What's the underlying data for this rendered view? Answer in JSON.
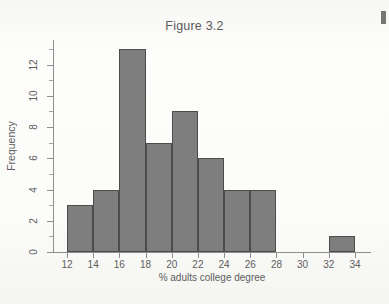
{
  "figure": {
    "title": "Figure 3.2"
  },
  "axes": {
    "y_title": "Frequency",
    "x_title": "% adults college degree",
    "y_ticks": [
      "0",
      "2",
      "4",
      "6",
      "8",
      "10",
      "12"
    ],
    "y_tick_values": [
      0,
      2,
      4,
      6,
      8,
      10,
      12
    ],
    "y_minor_values": [
      1,
      3,
      5,
      7,
      9,
      11,
      13
    ],
    "x_ticks": [
      "12",
      "14",
      "16",
      "18",
      "20",
      "22",
      "24",
      "26",
      "28",
      "30",
      "32",
      "34"
    ],
    "x_tick_values": [
      12,
      14,
      16,
      18,
      20,
      22,
      24,
      26,
      28,
      30,
      32,
      34
    ]
  },
  "style": {
    "bar_fill": "#7e7e7e",
    "bar_stroke": "#4c4c4c",
    "axis_color": "#8e8e8e",
    "text_color": "#5d5d5d",
    "page_background": "#fdfdfb"
  },
  "chart_data": {
    "type": "bar",
    "title": "Figure 3.2",
    "xlabel": "% adults college degree",
    "ylabel": "Frequency",
    "xlim": [
      11,
      35
    ],
    "ylim": [
      0,
      13
    ],
    "grid": false,
    "legend": null,
    "bin_width": 2,
    "bins": [
      {
        "x0": 12,
        "x1": 14,
        "frequency": 3
      },
      {
        "x0": 14,
        "x1": 16,
        "frequency": 4
      },
      {
        "x0": 16,
        "x1": 18,
        "frequency": 13
      },
      {
        "x0": 18,
        "x1": 20,
        "frequency": 7
      },
      {
        "x0": 20,
        "x1": 22,
        "frequency": 9
      },
      {
        "x0": 22,
        "x1": 24,
        "frequency": 6
      },
      {
        "x0": 24,
        "x1": 26,
        "frequency": 4
      },
      {
        "x0": 26,
        "x1": 28,
        "frequency": 4
      },
      {
        "x0": 28,
        "x1": 30,
        "frequency": 0
      },
      {
        "x0": 30,
        "x1": 32,
        "frequency": 0
      },
      {
        "x0": 32,
        "x1": 34,
        "frequency": 1
      }
    ],
    "categories": [
      "12-14",
      "14-16",
      "16-18",
      "18-20",
      "20-22",
      "22-24",
      "24-26",
      "26-28",
      "28-30",
      "30-32",
      "32-34"
    ],
    "values": [
      3,
      4,
      13,
      7,
      9,
      6,
      4,
      4,
      0,
      0,
      1
    ],
    "total_count": 51
  }
}
